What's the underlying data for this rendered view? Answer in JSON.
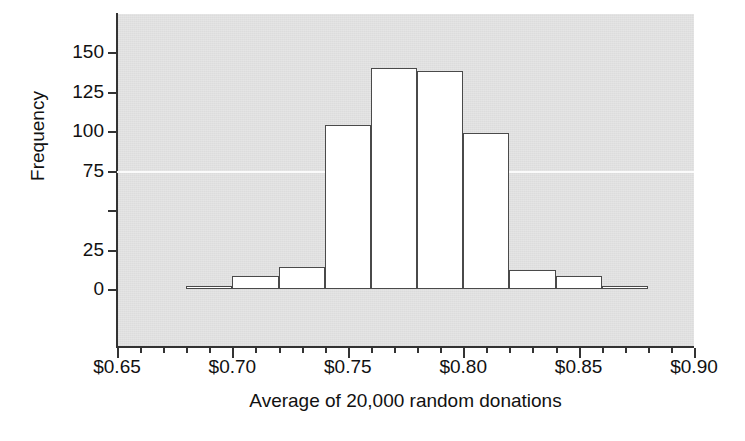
{
  "chart_data": {
    "type": "bar",
    "title": "",
    "xlabel": "Average of 20,000 random donations",
    "ylabel": "Frequency",
    "bin_width": 0.02,
    "bin_edges": [
      0.66,
      0.68,
      0.7,
      0.72,
      0.74,
      0.76,
      0.78,
      0.8,
      0.82,
      0.84,
      0.86,
      0.88
    ],
    "categories": [
      "0.66-0.68",
      "0.68-0.70",
      "0.70-0.72",
      "0.72-0.74",
      "0.74-0.76",
      "0.76-0.78",
      "0.78-0.80",
      "0.80-0.82",
      "0.82-0.84",
      "0.84-0.86",
      "0.86-0.88"
    ],
    "bin_centers": [
      0.67,
      0.69,
      0.71,
      0.73,
      0.75,
      0.77,
      0.79,
      0.81,
      0.83,
      0.85,
      0.87
    ],
    "values": [
      0,
      2,
      8,
      14,
      104,
      140,
      138,
      99,
      12,
      8,
      2
    ],
    "xlim": [
      0.65,
      0.9
    ],
    "ylim": [
      0,
      168
    ],
    "grid": "single white horizontal line at y=75",
    "legend": "none",
    "plot_background": "#dcdcdc",
    "bar_fill": "#ffffff",
    "bar_edge": "#4a4a4a"
  },
  "axes": {
    "y": {
      "title": "Frequency",
      "tick_labels": [
        "150",
        "125",
        "100",
        "75",
        "",
        "25",
        "0"
      ],
      "tick_values": [
        150,
        125,
        100,
        75,
        50,
        25,
        0
      ]
    },
    "x": {
      "title": "Average of 20,000 random donations",
      "tick_labels": [
        "$0.65",
        "$0.70",
        "$0.75",
        "$0.80",
        "$0.85",
        "$0.90"
      ],
      "tick_values": [
        0.65,
        0.7,
        0.75,
        0.8,
        0.85,
        0.9
      ],
      "minor_ticks": [
        0.66,
        0.67,
        0.68,
        0.69,
        0.71,
        0.72,
        0.73,
        0.74,
        0.76,
        0.77,
        0.78,
        0.79,
        0.81,
        0.82,
        0.83,
        0.84,
        0.86,
        0.87,
        0.88,
        0.89
      ]
    }
  }
}
